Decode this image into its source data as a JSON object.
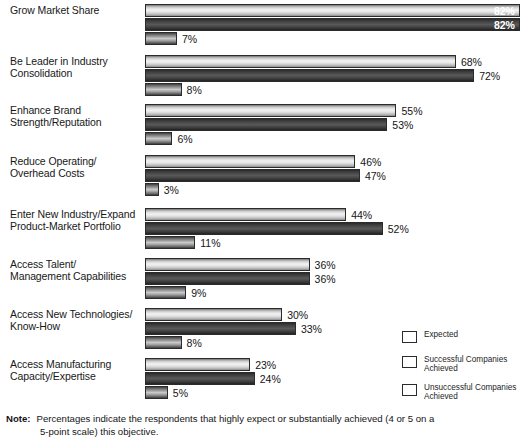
{
  "chart_data": {
    "type": "bar",
    "orientation": "horizontal",
    "title": "",
    "xlabel": "",
    "ylabel": "",
    "xlim": [
      0,
      82
    ],
    "grid": false,
    "legend_position": "bottom-right",
    "value_suffix": "%",
    "categories": [
      "Grow Market Share",
      "Be Leader in Industry\nConsolidation",
      "Enhance Brand\nStrength/Reputation",
      "Reduce Operating/\nOverhead Costs",
      "Enter New Industry/Expand\nProduct-Market Portfolio",
      "Access Talent/\nManagement Capabilities",
      "Access New Technologies/\nKnow-How",
      "Access Manufacturing\nCapacity/Expertise"
    ],
    "series": [
      {
        "name": "Expected",
        "values": [
          82,
          68,
          55,
          46,
          44,
          36,
          30,
          23
        ],
        "labels": [
          "82%",
          "68%",
          "55%",
          "46%",
          "44%",
          "36%",
          "30%",
          "23%"
        ],
        "color": "#e8e8e8"
      },
      {
        "name": "Successful Companies Achieved",
        "values": [
          82,
          72,
          53,
          47,
          52,
          36,
          33,
          24
        ],
        "labels": [
          "82%",
          "72%",
          "53%",
          "47%",
          "52%",
          "36%",
          "33%",
          "24%"
        ],
        "color": "#3f3f3f"
      },
      {
        "name": "Unsuccessful Companies Achieved",
        "values": [
          7,
          8,
          6,
          3,
          11,
          9,
          8,
          5
        ],
        "labels": [
          "7%",
          "8%",
          "6%",
          "3%",
          "11%",
          "9%",
          "8%",
          "5%"
        ],
        "color": "#8f8f8f"
      }
    ]
  },
  "legend": {
    "items": [
      {
        "label": "Expected"
      },
      {
        "label": "Successful Companies\nAchieved"
      },
      {
        "label": "Unsuccessful Companies\nAchieved"
      }
    ]
  },
  "note": {
    "word": "Note:",
    "line1": "Percentages indicate the respondents that highly expect or substantially achieved (4 or 5 on a",
    "line2": "5-point scale) this objective."
  }
}
